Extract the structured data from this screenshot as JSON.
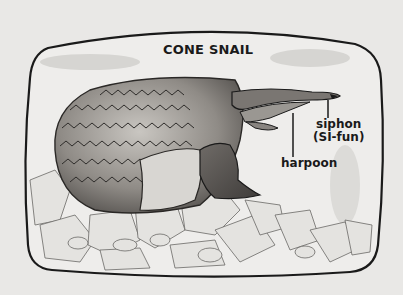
{
  "diagram": {
    "title": "CONE SNAIL",
    "labels": {
      "siphon": "siphon",
      "siphon_pronunciation": "(SI-fun)",
      "harpoon": "harpoon"
    },
    "colors": {
      "background": "#e9e8e6",
      "frame": "#1a1a1a",
      "shell": "#8a8782",
      "text": "#1a1a1a"
    }
  }
}
